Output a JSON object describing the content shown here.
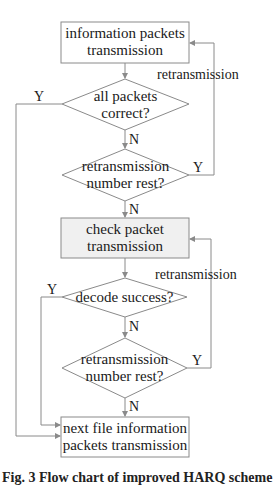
{
  "diagram": {
    "type": "flowchart",
    "colors": {
      "stroke": "#8a8a8a",
      "box_fill": "#ffffff",
      "check_box_fill": "#f0f0f0",
      "text": "#1a1a1a"
    },
    "nodes": {
      "info_tx": {
        "line1": "information packets",
        "line2": "transmission"
      },
      "all_correct": {
        "line1": "all packets",
        "line2": "correct?"
      },
      "retx_rest_1": {
        "line1": "retransmission",
        "line2": "number rest?"
      },
      "check_tx": {
        "line1": "check packet",
        "line2": "transmission"
      },
      "decode_ok": {
        "line1": "decode success?"
      },
      "retx_rest_2": {
        "line1": "retransmission",
        "line2": "number rest?"
      },
      "next_file": {
        "line1": "next file information",
        "line2": "packets transmission"
      }
    },
    "labels": {
      "retransmission_1": "retransmission",
      "retransmission_2": "retransmission",
      "y_all_correct": "Y",
      "n_all_correct": "N",
      "y_retx_1": "Y",
      "n_retx_1": "N",
      "y_decode": "Y",
      "n_decode": "N",
      "y_retx_2": "Y",
      "n_retx_2": "N"
    },
    "caption": "Fig. 3  Flow chart of improved HARQ scheme"
  }
}
